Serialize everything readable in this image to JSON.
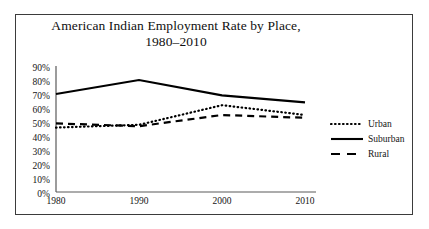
{
  "chart_data": {
    "type": "line",
    "title": "American Indian Employment Rate by Place, 1980–2010",
    "title_line1": "American Indian Employment Rate by Place,",
    "title_line2": "1980–2010",
    "xlabel": "",
    "ylabel": "",
    "x": [
      1980,
      1990,
      2000,
      2010
    ],
    "categories": [
      "1980",
      "1990",
      "2000",
      "2010"
    ],
    "xtick_labels": [
      "1980",
      "1990",
      "2000",
      "2010"
    ],
    "ytick_labels": [
      "90%",
      "80%",
      "70%",
      "60%",
      "50%",
      "40%",
      "30%",
      "20%",
      "10%",
      "0%"
    ],
    "ytick_values": [
      90,
      80,
      70,
      60,
      50,
      40,
      30,
      20,
      10,
      0
    ],
    "ylim": [
      0,
      90
    ],
    "xlim": [
      1980,
      2010
    ],
    "grid": false,
    "legend_position": "right",
    "series": [
      {
        "name": "Urban",
        "style": "dotted",
        "color": "#000000",
        "values": [
          46,
          48,
          62,
          55
        ]
      },
      {
        "name": "Suburban",
        "style": "solid",
        "color": "#000000",
        "values": [
          70,
          80,
          69,
          64
        ]
      },
      {
        "name": "Rural",
        "style": "dashed",
        "color": "#000000",
        "values": [
          49,
          47,
          55,
          53
        ]
      }
    ]
  },
  "legend": {
    "items": [
      {
        "label": "Urban",
        "style": "dotted"
      },
      {
        "label": "Suburban",
        "style": "solid"
      },
      {
        "label": "Rural",
        "style": "dashed"
      }
    ]
  },
  "axes": {
    "y_ticks": [
      "90%",
      "80%",
      "70%",
      "60%",
      "50%",
      "40%",
      "30%",
      "20%",
      "10%",
      "0%"
    ],
    "x_ticks": [
      "1980",
      "1990",
      "2000",
      "2010"
    ]
  },
  "colors": {
    "frame": "#3b3b3b",
    "axis": "#5a5a5a",
    "series": "#000000",
    "text": "#141414",
    "background": "#ffffff"
  }
}
